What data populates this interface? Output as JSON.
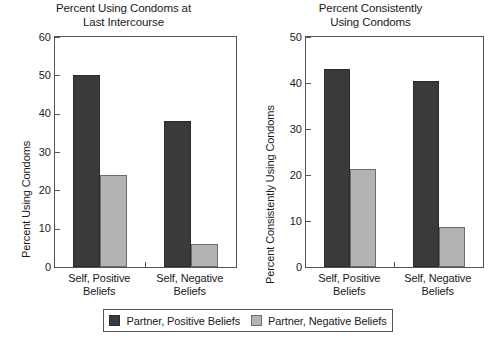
{
  "chart_data": [
    {
      "type": "bar",
      "panel": "left",
      "title": "Percent Using Condoms at\nLast Intercourse",
      "xlabel": "",
      "ylabel": "Percent Using Condoms",
      "ylim": [
        0,
        60
      ],
      "yticks": [
        0,
        10,
        20,
        30,
        40,
        50,
        60
      ],
      "ytick_labels": [
        "0",
        "10",
        "20",
        "30",
        "40",
        "50",
        "60"
      ],
      "grid": false,
      "legend_position": "bottom-outside-shared",
      "categories": [
        "Self, Positive\nBeliefs",
        "Self, Negative\nBeliefs"
      ],
      "series": [
        {
          "name": "Partner, Positive Beliefs",
          "color": "#3a3a3a",
          "values": [
            50,
            38
          ]
        },
        {
          "name": "Partner, Negative Beliefs",
          "color": "#b3b3b3",
          "values": [
            24,
            6
          ]
        }
      ]
    },
    {
      "type": "bar",
      "panel": "right",
      "title": "Percent Consistently\nUsing Condoms",
      "xlabel": "",
      "ylabel": "Percent Consistently Using Condoms",
      "ylim": [
        0,
        50
      ],
      "yticks": [
        0,
        10,
        20,
        30,
        40,
        50
      ],
      "ytick_labels": [
        "0",
        "10",
        "20",
        "30",
        "40",
        "50"
      ],
      "grid": false,
      "legend_position": "bottom-outside-shared",
      "categories": [
        "Self, Positive\nBeliefs",
        "Self, Negative\nBeliefs"
      ],
      "series": [
        {
          "name": "Partner, Positive Beliefs",
          "color": "#3a3a3a",
          "values": [
            43,
            40.4
          ]
        },
        {
          "name": "Partner, Negative Beliefs",
          "color": "#b3b3b3",
          "values": [
            21.3,
            8.7
          ]
        }
      ]
    }
  ],
  "legend": {
    "entries": [
      {
        "label": "Partner, Positive Beliefs",
        "color": "#3a3a3a"
      },
      {
        "label": "Partner, Negative Beliefs",
        "color": "#b3b3b3"
      }
    ]
  },
  "colors": {
    "dark_bar": "#3a3a3a",
    "light_bar": "#b3b3b3",
    "axis": "#555555",
    "text": "#1a1a1a",
    "background": "#ffffff"
  }
}
